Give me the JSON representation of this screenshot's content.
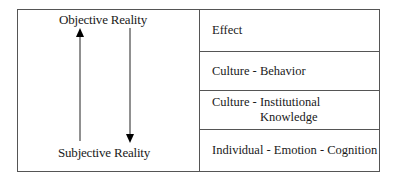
{
  "diagram": {
    "left_panel": {
      "top_label": "Objective Reality",
      "bottom_label": "Subjective Reality",
      "arrows": [
        {
          "direction": "up",
          "from": "Subjective Reality",
          "to": "Objective Reality"
        },
        {
          "direction": "down",
          "from": "Objective Reality",
          "to": "Subjective Reality"
        }
      ]
    },
    "right_panel": {
      "rows": [
        {
          "label": "Effect"
        },
        {
          "label": "Culture - Behavior"
        },
        {
          "label_line1": "Culture - Institutional",
          "label_line2": "Knowledge"
        },
        {
          "label": "Individual - Emotion - Cognition"
        }
      ]
    },
    "colors": {
      "line": "#555555",
      "text": "#1a1a1a",
      "arrow": "#000000"
    }
  }
}
